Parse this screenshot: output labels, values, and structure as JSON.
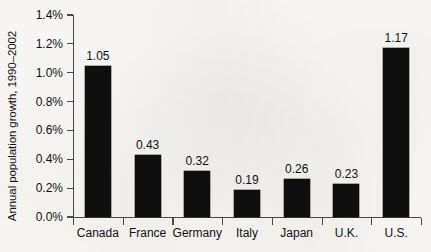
{
  "chart_data": {
    "type": "bar",
    "title": "",
    "xlabel": "",
    "ylabel": "Annual population growth, 1990–2002",
    "categories": [
      "Canada",
      "France",
      "Germany",
      "Italy",
      "Japan",
      "U.K.",
      "U.S."
    ],
    "values": [
      1.05,
      0.43,
      0.32,
      0.19,
      0.26,
      0.23,
      1.17
    ],
    "value_labels": [
      "1.05",
      "0.43",
      "0.32",
      "0.19",
      "0.26",
      "0.23",
      "1.17"
    ],
    "ytick_labels": [
      "0.0%",
      "0.2%",
      "0.4%",
      "0.6%",
      "0.8%",
      "1.0%",
      "1.2%",
      "1.4%"
    ],
    "ytick_values": [
      0.0,
      0.2,
      0.4,
      0.6,
      0.8,
      1.0,
      1.2,
      1.4
    ],
    "ylim": [
      0.0,
      1.4
    ],
    "grid": false,
    "legend": false,
    "bar_color": "#100f0f",
    "axis_color": "#4a4a4a",
    "background_color": "#fbfaf8",
    "text_color": "#111111"
  }
}
